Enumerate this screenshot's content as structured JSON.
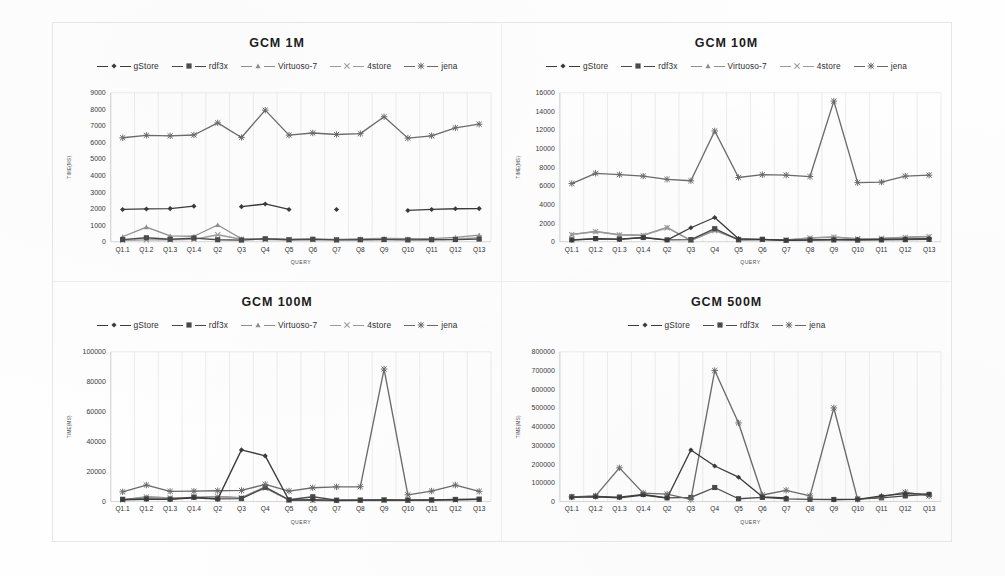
{
  "page": {
    "background_color": "#fefefe",
    "panel_border_color": "#e6e6e6"
  },
  "series_styles": {
    "gStore": {
      "color": "#3b3b3b",
      "marker": "diamond"
    },
    "rdf3x": {
      "color": "#4a4a4a",
      "marker": "square"
    },
    "Virtuoso-7": {
      "color": "#8e8e8e",
      "marker": "triangle"
    },
    "4store": {
      "color": "#9a9a9a",
      "marker": "cross"
    },
    "jena": {
      "color": "#6a6a6a",
      "marker": "star"
    }
  },
  "categories": [
    "Q1.1",
    "Q1.2",
    "Q1.3",
    "Q1.4",
    "Q2",
    "Q3",
    "Q4",
    "Q5",
    "Q6",
    "Q7",
    "Q8",
    "Q9",
    "Q10",
    "Q11",
    "Q12",
    "Q13"
  ],
  "charts": [
    {
      "id": "gcm-1m",
      "title": "GCM 1M",
      "chart_data": {
        "type": "line",
        "title": "GCM 1M",
        "xlabel": "QUERY",
        "ylabel": "TIME(MS)",
        "ylim": [
          0,
          9000
        ],
        "ytick_step": 1000,
        "yticks": [
          0,
          1000,
          2000,
          3000,
          4000,
          5000,
          6000,
          7000,
          8000,
          9000
        ],
        "grid": true,
        "legend_position": "top",
        "categories": [
          "Q1.1",
          "Q1.2",
          "Q1.3",
          "Q1.4",
          "Q2",
          "Q3",
          "Q4",
          "Q5",
          "Q6",
          "Q7",
          "Q8",
          "Q9",
          "Q10",
          "Q11",
          "Q12",
          "Q13"
        ],
        "series": [
          {
            "name": "gStore",
            "values": [
              1950,
              1980,
              2000,
              2150,
              null,
              2120,
              2280,
              1950,
              null,
              1950,
              null,
              null,
              1890,
              1950,
              1990,
              2000
            ]
          },
          {
            "name": "rdf3x",
            "values": [
              130,
              240,
              150,
              220,
              120,
              100,
              180,
              120,
              150,
              110,
              120,
              130,
              110,
              120,
              130,
              160
            ]
          },
          {
            "name": "Virtuoso-7",
            "values": [
              300,
              880,
              350,
              330,
              1010,
              180,
              170,
              150,
              160,
              140,
              170,
              200,
              180,
              190,
              260,
              400
            ]
          },
          {
            "name": "4store",
            "values": [
              90,
              110,
              120,
              140,
              420,
              150,
              130,
              120,
              130,
              120,
              130,
              140,
              130,
              140,
              160,
              240
            ]
          },
          {
            "name": "jena",
            "values": [
              6280,
              6430,
              6400,
              6450,
              7180,
              6300,
              7950,
              6440,
              6570,
              6480,
              6530,
              7550,
              6260,
              6400,
              6880,
              7100
            ]
          }
        ]
      }
    },
    {
      "id": "gcm-10m",
      "title": "GCM 10M",
      "chart_data": {
        "type": "line",
        "title": "GCM 10M",
        "xlabel": "QUERY",
        "ylabel": "TIME(MS)",
        "ylim": [
          0,
          16000
        ],
        "ytick_step": 2000,
        "yticks": [
          0,
          2000,
          4000,
          6000,
          8000,
          10000,
          12000,
          14000,
          16000
        ],
        "grid": true,
        "legend_position": "top",
        "categories": [
          "Q1.1",
          "Q1.2",
          "Q1.3",
          "Q1.4",
          "Q2",
          "Q3",
          "Q4",
          "Q5",
          "Q6",
          "Q7",
          "Q8",
          "Q9",
          "Q10",
          "Q11",
          "Q12",
          "Q13"
        ],
        "series": [
          {
            "name": "gStore",
            "values": [
              170,
              320,
              250,
              430,
              180,
              1500,
              2600,
              330,
              250,
              160,
              200,
              240,
              220,
              250,
              300,
              330
            ]
          },
          {
            "name": "rdf3x",
            "values": [
              200,
              340,
              280,
              450,
              200,
              230,
              1400,
              200,
              260,
              150,
              180,
              190,
              170,
              190,
              220,
              250
            ]
          },
          {
            "name": "Virtuoso-7",
            "values": [
              780,
              1100,
              760,
              700,
              1550,
              120,
              1250,
              230,
              200,
              180,
              420,
              520,
              300,
              350,
              480,
              560
            ]
          },
          {
            "name": "4store",
            "values": [
              760,
              1080,
              720,
              680,
              1500,
              150,
              1200,
              250,
              230,
              200,
              400,
              500,
              320,
              360,
              470,
              540
            ]
          },
          {
            "name": "jena",
            "values": [
              6250,
              7350,
              7200,
              7050,
              6700,
              6550,
              11900,
              6900,
              7200,
              7150,
              7000,
              15100,
              6350,
              6400,
              7050,
              7150
            ]
          }
        ]
      }
    },
    {
      "id": "gcm-100m",
      "title": "GCM 100M",
      "chart_data": {
        "type": "line",
        "title": "GCM 100M",
        "xlabel": "QUERY",
        "ylabel": "TIME(MS)",
        "ylim": [
          0,
          100000
        ],
        "ytick_step": 20000,
        "yticks": [
          0,
          20000,
          40000,
          60000,
          80000,
          100000
        ],
        "grid": true,
        "legend_position": "top",
        "categories": [
          "Q1.1",
          "Q1.2",
          "Q1.3",
          "Q1.4",
          "Q2",
          "Q3",
          "Q4",
          "Q5",
          "Q6",
          "Q7",
          "Q8",
          "Q9",
          "Q10",
          "Q11",
          "Q12",
          "Q13"
        ],
        "series": [
          {
            "name": "gStore",
            "values": [
              1200,
              1500,
              1400,
              2500,
              1600,
              34500,
              30500,
              900,
              1200,
              800,
              900,
              1000,
              950,
              1000,
              1300,
              1500
            ]
          },
          {
            "name": "rdf3x",
            "values": [
              1500,
              1800,
              1600,
              3000,
              1800,
              2000,
              9500,
              1200,
              3200,
              900,
              1000,
              1100,
              1000,
              1100,
              1400,
              1600
            ]
          },
          {
            "name": "Virtuoso-7",
            "values": [
              1100,
              3200,
              2500,
              2700,
              3400,
              2600,
              9800,
              900,
              800,
              700,
              800,
              900,
              800,
              900,
              1100,
              1500
            ]
          },
          {
            "name": "4store",
            "values": [
              1000,
              3000,
              2400,
              2600,
              3200,
              2500,
              9000,
              850,
              750,
              700,
              800,
              900,
              800,
              900,
              1050,
              1400
            ]
          },
          {
            "name": "jena",
            "values": [
              6500,
              11000,
              6800,
              6900,
              7200,
              7400,
              11500,
              7000,
              9200,
              9800,
              9900,
              88500,
              4500,
              7000,
              11000,
              6800
            ]
          }
        ]
      }
    },
    {
      "id": "gcm-500m",
      "title": "GCM 500M",
      "chart_data": {
        "type": "line",
        "title": "GCM 500M",
        "xlabel": "QUERY",
        "ylabel": "TIME(MS)",
        "ylim": [
          0,
          800000
        ],
        "ytick_step": 100000,
        "yticks": [
          0,
          100000,
          200000,
          300000,
          400000,
          500000,
          600000,
          700000,
          800000
        ],
        "grid": true,
        "legend_position": "top",
        "categories": [
          "Q1.1",
          "Q1.2",
          "Q1.3",
          "Q1.4",
          "Q2",
          "Q3",
          "Q4",
          "Q5",
          "Q6",
          "Q7",
          "Q8",
          "Q9",
          "Q10",
          "Q11",
          "Q12",
          "Q13"
        ],
        "series": [
          {
            "name": "gStore",
            "values": [
              22000,
              25000,
              20000,
              35000,
              18000,
              275000,
              190000,
              130000,
              25000,
              20000,
              null,
              10000,
              12000,
              30000,
              42000,
              40000
            ]
          },
          {
            "name": "rdf3x",
            "values": [
              25000,
              28000,
              24000,
              38000,
              20000,
              22000,
              75000,
              15000,
              22000,
              14000,
              12000,
              11000,
              13000,
              20000,
              30000,
              38000
            ]
          },
          {
            "name": "jena",
            "values": [
              25000,
              30000,
              180000,
              45000,
              40000,
              12000,
              700000,
              420000,
              35000,
              60000,
              30000,
              500000,
              12000,
              25000,
              50000,
              30000
            ]
          }
        ]
      }
    }
  ]
}
